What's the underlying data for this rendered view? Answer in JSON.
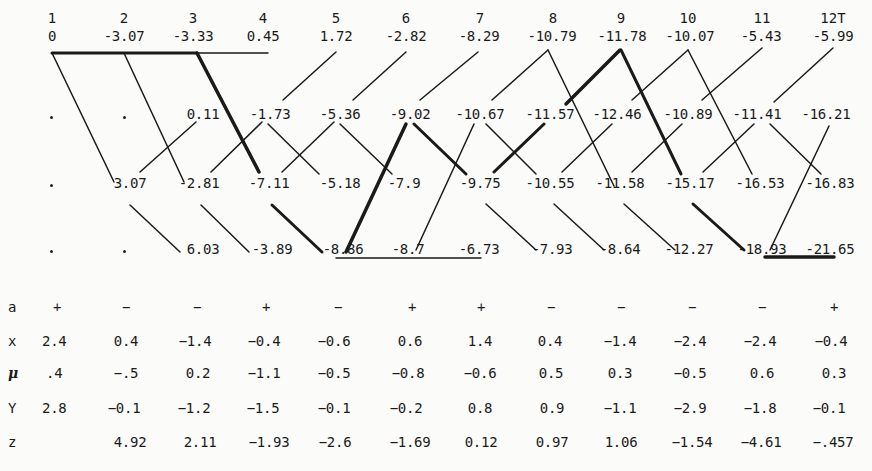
{
  "stages": [
    "1",
    "2",
    "3",
    "4",
    "5",
    "6",
    "7",
    "8",
    "9",
    "10",
    "11",
    "12T"
  ],
  "grid": {
    "row0": [
      "0",
      "-3.07",
      "-3.33",
      "0.45",
      "1.72",
      "-2.82",
      "-8.29",
      "-10.79",
      "-11.78",
      "-10.07",
      "-5.43",
      "-5.99"
    ],
    "row1": [
      "·",
      "·",
      "0.11",
      "-1.73",
      "-5.36",
      "-9.02",
      "-10.67",
      "-11.57",
      "-12.46",
      "-10.89",
      "-11.41",
      "-16.21"
    ],
    "row2": [
      "·",
      "3.07",
      "-2.81",
      "-7.11",
      "-5.18",
      "-7.9",
      "-9.75",
      "-10.55",
      "-11.58",
      "-15.17",
      "-16.53",
      "-16.83"
    ],
    "row3": [
      "·",
      "·",
      "6.03",
      "-3.89",
      "-8.86",
      "-8.7",
      "-6.73",
      "-7.93",
      "-8.64",
      "-12.27",
      "-18.93",
      "-21.65"
    ]
  },
  "table": {
    "labels": {
      "a": "a",
      "x": "x",
      "mu": "μ",
      "y": "Y",
      "z": "z"
    },
    "a": [
      "+",
      "−",
      "−",
      "+",
      "−",
      "+",
      "+",
      "−",
      "−",
      "−",
      "−",
      "+"
    ],
    "x": [
      "2.4",
      "0.4",
      "−1.4",
      "−0.4",
      "−0.6",
      "0.6",
      "1.4",
      "0.4",
      "−1.4",
      "−2.4",
      "−2.4",
      "−0.4"
    ],
    "mu": [
      ".4",
      "−.5",
      "0.2",
      "−1.1",
      "−0.5",
      "−0.8",
      "−0.6",
      "0.5",
      "0.3",
      "−0.5",
      "0.6",
      "0.3"
    ],
    "y": [
      "2.8",
      "−0.1",
      "−1.2",
      "−1.5",
      "−0.1",
      "−0.2",
      "0.8",
      "0.9",
      "−1.1",
      "−2.9",
      "−1.8",
      "−0.1"
    ],
    "z": [
      "",
      "4.92",
      "2.11",
      "−1.93",
      "−2.6",
      "−1.69",
      "0.12",
      "0.97",
      "1.06",
      "−1.54",
      "−4.61",
      "−.457"
    ]
  },
  "colors": {
    "ink": "#1a1a1a",
    "background": "#fbfbfa"
  }
}
